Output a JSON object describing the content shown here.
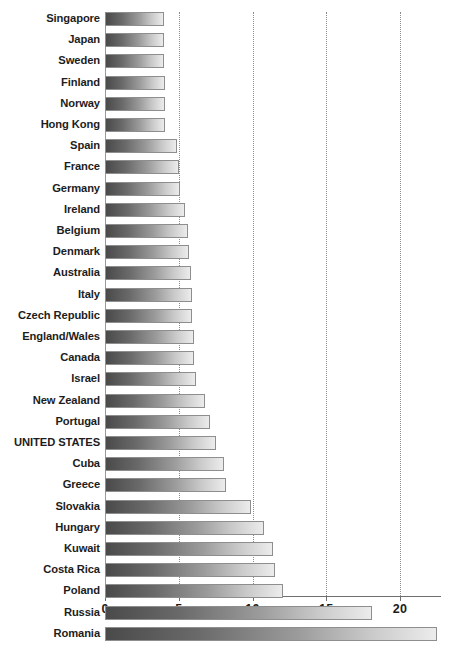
{
  "chart_data": {
    "type": "bar",
    "orientation": "horizontal",
    "title": "",
    "xlabel": "",
    "ylabel": "",
    "xlim": [
      0,
      22.8
    ],
    "grid": true,
    "gridlines_x": [
      5,
      10,
      15,
      20
    ],
    "xticks": [
      0,
      5,
      10,
      15,
      20
    ],
    "xtick_labels": [
      "0",
      "5",
      "10",
      "15",
      "20"
    ],
    "legend": "none",
    "categories": [
      "Singapore",
      "Japan",
      "Sweden",
      "Finland",
      "Norway",
      "Hong Kong",
      "Spain",
      "France",
      "Germany",
      "Ireland",
      "Belgium",
      "Denmark",
      "Australia",
      "Italy",
      "Czech Republic",
      "England/Wales",
      "Canada",
      "Israel",
      "New Zealand",
      "Portugal",
      "UNITED STATES",
      "Cuba",
      "Greece",
      "Slovakia",
      "Hungary",
      "Kuwait",
      "Costa Rica",
      "Poland",
      "Russia",
      "Romania"
    ],
    "values": [
      4.0,
      4.0,
      4.0,
      4.1,
      4.1,
      4.1,
      4.9,
      5.0,
      5.1,
      5.4,
      5.6,
      5.7,
      5.8,
      5.9,
      5.9,
      6.0,
      6.0,
      6.2,
      6.8,
      7.1,
      7.5,
      8.1,
      8.2,
      9.9,
      10.8,
      11.4,
      11.5,
      12.1,
      18.1,
      22.5
    ],
    "colors": {
      "bar_gradient_start": "#4a4a4a",
      "bar_gradient_end": "#ececec",
      "bar_border": "#8e8e8e",
      "gridline": "#8c8c8c",
      "axis": "#6f6f6f",
      "label_text": "#1d1d1d",
      "background": "#ffffff"
    }
  }
}
